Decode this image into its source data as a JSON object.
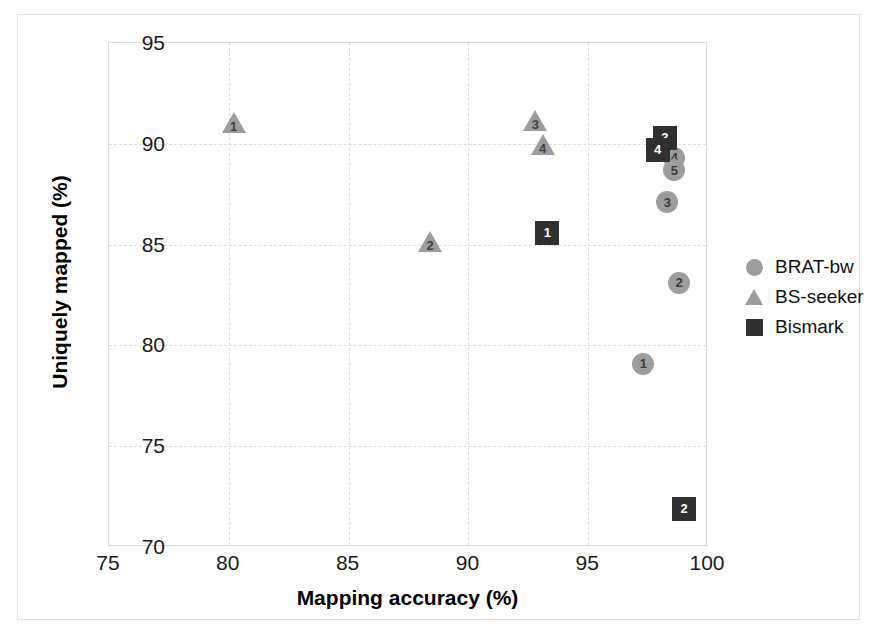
{
  "chart_data": {
    "type": "scatter",
    "title": "",
    "xlabel": "Mapping accuracy (%)",
    "ylabel": "Uniquely mapped (%)",
    "xlim": [
      75,
      100
    ],
    "ylim": [
      70,
      95
    ],
    "xticks": [
      "75",
      "80",
      "85",
      "90",
      "95",
      "100"
    ],
    "yticks": [
      "70",
      "75",
      "80",
      "85",
      "90",
      "95"
    ],
    "grid": true,
    "legend_position": "right",
    "series": [
      {
        "name": "BRAT-bw",
        "marker": "circle",
        "color": "#9d9d9d",
        "points": [
          {
            "label": "1",
            "x": 97.3,
            "y": 79.1
          },
          {
            "label": "2",
            "x": 98.8,
            "y": 83.1
          },
          {
            "label": "3",
            "x": 98.3,
            "y": 87.1
          },
          {
            "label": "4",
            "x": 98.6,
            "y": 89.3
          },
          {
            "label": "5",
            "x": 98.6,
            "y": 88.7
          }
        ]
      },
      {
        "name": "BS-seeker",
        "marker": "triangle",
        "color": "#9d9d9d",
        "points": [
          {
            "label": "1",
            "x": 80.2,
            "y": 91.0
          },
          {
            "label": "2",
            "x": 88.4,
            "y": 85.1
          },
          {
            "label": "3",
            "x": 92.8,
            "y": 91.1
          },
          {
            "label": "4",
            "x": 93.1,
            "y": 89.9
          }
        ]
      },
      {
        "name": "Bismark",
        "marker": "square",
        "color": "#303030",
        "points": [
          {
            "label": "1",
            "x": 93.3,
            "y": 85.6
          },
          {
            "label": "2",
            "x": 99.0,
            "y": 71.9
          },
          {
            "label": "3",
            "x": 98.2,
            "y": 90.3
          },
          {
            "label": "4",
            "x": 97.9,
            "y": 89.7
          }
        ]
      }
    ]
  },
  "legend": {
    "items": [
      {
        "label": "BRAT-bw",
        "marker": "circle"
      },
      {
        "label": "BS-seeker",
        "marker": "triangle"
      },
      {
        "label": "Bismark",
        "marker": "square"
      }
    ]
  }
}
